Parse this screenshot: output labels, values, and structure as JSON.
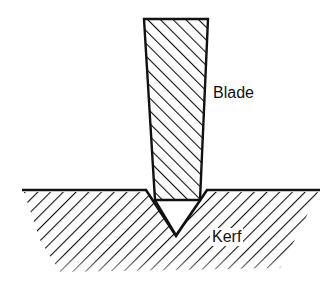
{
  "diagram": {
    "labels": {
      "blade": "Blade",
      "kerf": "Kerf"
    },
    "colors": {
      "stroke": "#111111",
      "background": "#ffffff"
    }
  }
}
